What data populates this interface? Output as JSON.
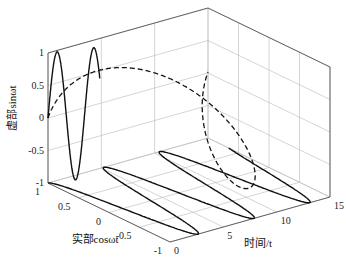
{
  "chart_data": {
    "type": "line",
    "dimension": "3d",
    "title": "",
    "xlabel": "时间/t",
    "ylabel": "实部cosωt",
    "zlabel": "虚部sinωt",
    "axes": {
      "t": {
        "range": [
          0,
          15
        ],
        "ticks": [
          "0",
          "5",
          "10",
          "15"
        ]
      },
      "real": {
        "range": [
          -1,
          1
        ],
        "ticks": [
          "-1",
          "-0.5",
          "0",
          "0.5",
          "1"
        ]
      },
      "imag": {
        "range": [
          -1,
          1
        ],
        "ticks": [
          "-1",
          "-0.5",
          "0",
          "0.5",
          "1"
        ]
      }
    },
    "grid": true,
    "legend": null,
    "series": [
      {
        "name": "e^(jωt) helix",
        "style": "dashed",
        "omega": 0.42,
        "t_range": [
          0,
          15
        ],
        "projection": "3d"
      },
      {
        "name": "sinωt (imag part, back wall)",
        "style": "solid",
        "omega": 1.2,
        "t_range": [
          0,
          7.4
        ],
        "projection": "wall"
      },
      {
        "name": "cosωt (real part, floor)",
        "style": "solid",
        "omega": 1.2,
        "t_range": [
          0,
          15
        ],
        "projection": "floor"
      }
    ]
  }
}
